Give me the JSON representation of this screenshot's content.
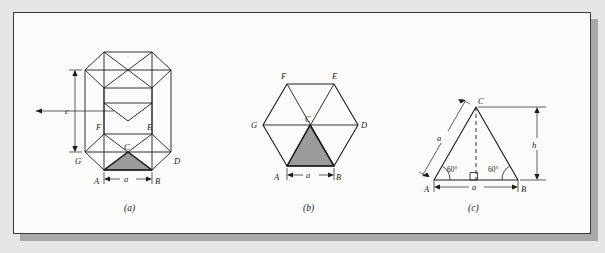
{
  "figure": {
    "kind": "textbook-line-drawing",
    "page_background": "#e6e6e4",
    "plate_background": "#fbfbfa",
    "ink_color": "#1c1c1c",
    "shade_fill": "#9b9b9b",
    "shadow_color": "#a9a9a7"
  },
  "panels": [
    {
      "id": "a",
      "caption": "(a)",
      "title": "hexagonal prism unit cell",
      "vertex_labels": [
        "F",
        "E",
        "G",
        "C",
        "D",
        "A",
        "B"
      ],
      "dimensions": [
        {
          "name": "c",
          "label": "c",
          "orientation": "vertical"
        },
        {
          "name": "a",
          "label": "a",
          "orientation": "horizontal"
        }
      ]
    },
    {
      "id": "b",
      "caption": "(b)",
      "title": "basal hexagon",
      "vertex_labels": [
        "F",
        "E",
        "G",
        "C",
        "D",
        "A",
        "B"
      ],
      "dimensions": [
        {
          "name": "a",
          "label": "a",
          "orientation": "horizontal"
        }
      ]
    },
    {
      "id": "c",
      "caption": "(c)",
      "title": "equilateral triangle",
      "vertex_labels": [
        "C",
        "A",
        "B"
      ],
      "angle_labels": [
        "60°",
        "60°"
      ],
      "dimensions": [
        {
          "name": "a-side",
          "label": "a",
          "orientation": "slanted"
        },
        {
          "name": "a-base",
          "label": "a",
          "orientation": "horizontal"
        },
        {
          "name": "h",
          "label": "h",
          "orientation": "vertical"
        }
      ],
      "markers": [
        "right-angle-square",
        "dashed-altitude"
      ]
    }
  ],
  "labels": {
    "A": "A",
    "B": "B",
    "C": "C",
    "D": "D",
    "E": "E",
    "F": "F",
    "G": "G",
    "a": "a",
    "c": "c",
    "h": "h",
    "angle60": "60°"
  },
  "captions": {
    "a": "(a)",
    "b": "(b)",
    "c": "(c)"
  }
}
